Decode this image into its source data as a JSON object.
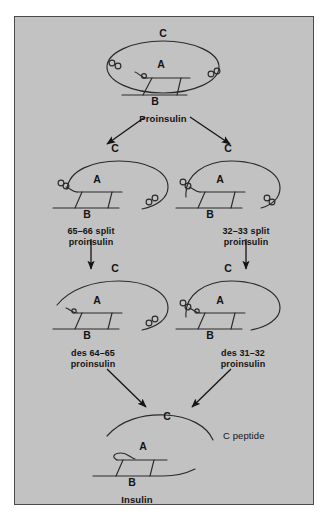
{
  "figure": {
    "background_color": "#ffffff",
    "panel_color": "#c2c2c2",
    "line_color": "#1a1a1a",
    "border_color": "#4a4a4a"
  },
  "chain_labels": {
    "a": "A",
    "b": "B",
    "c": "C"
  },
  "nodes": [
    {
      "id": "proinsulin",
      "name": "Proinsulin",
      "name_line2": "",
      "c_label": "C",
      "a_label": "A",
      "b_label": "B"
    },
    {
      "id": "split-65-66",
      "name": "65–66 split",
      "name_line2": "proinsulin",
      "c_label": "C",
      "a_label": "A",
      "b_label": "B"
    },
    {
      "id": "split-32-33",
      "name": "32–33 split",
      "name_line2": "proinsulin",
      "c_label": "C",
      "a_label": "A",
      "b_label": "B"
    },
    {
      "id": "des-64-65",
      "name": "des 64–65",
      "name_line2": "proinsulin",
      "c_label": "C",
      "a_label": "A",
      "b_label": "B"
    },
    {
      "id": "des-31-32",
      "name": "des 31–32",
      "name_line2": "proinsulin",
      "c_label": "C",
      "a_label": "A",
      "b_label": "B"
    },
    {
      "id": "insulin",
      "name": "Insulin",
      "name_line2": "",
      "c_label": "C",
      "a_label": "A",
      "b_label": "B",
      "side_note": "C peptide"
    }
  ],
  "arrows": [
    {
      "id": "proinsulin-to-65-66",
      "direction": "down-left"
    },
    {
      "id": "proinsulin-to-32-33",
      "direction": "down-right"
    },
    {
      "id": "split-65-66-to-des-64-65",
      "direction": "down"
    },
    {
      "id": "split-32-33-to-des-31-32",
      "direction": "down"
    },
    {
      "id": "des-64-65-to-insulin",
      "direction": "down-right"
    },
    {
      "id": "des-31-32-to-insulin",
      "direction": "down-left"
    }
  ]
}
